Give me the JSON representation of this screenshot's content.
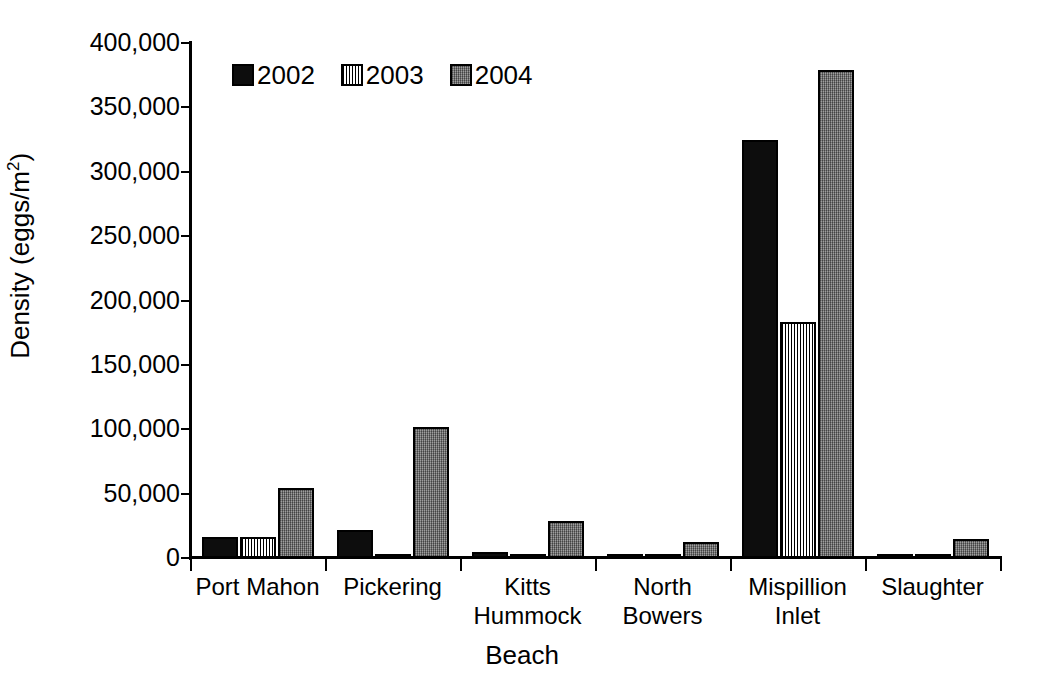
{
  "chart_data": {
    "type": "bar",
    "title": "",
    "xlabel": "Beach",
    "ylabel": "Density (eggs/m2)",
    "ylabel_base": "Density (eggs/m",
    "ylabel_sup": "2",
    "ylabel_close": ")",
    "categories": [
      "Port Mahon",
      "Pickering",
      "Kitts Hummock",
      "North Bowers",
      "Mispillion Inlet",
      "Slaughter"
    ],
    "category_lines": [
      [
        "Port Mahon"
      ],
      [
        "Pickering"
      ],
      [
        "Kitts",
        "Hummock"
      ],
      [
        "North",
        "Bowers"
      ],
      [
        "Mispillion",
        "Inlet"
      ],
      [
        "Slaughter"
      ]
    ],
    "series": [
      {
        "name": "2002",
        "pattern": "solid-black",
        "color": "#0d0d0d",
        "values": [
          16000,
          22000,
          5000,
          1500,
          325000,
          2500
        ]
      },
      {
        "name": "2003",
        "pattern": "vertical-hatch-white",
        "color": "#ffffff",
        "values": [
          16500,
          3000,
          2500,
          1500,
          183000,
          2500
        ]
      },
      {
        "name": "2004",
        "pattern": "gray-stipple",
        "color": "#7c7c7c",
        "values": [
          54000,
          102000,
          29000,
          12500,
          379000,
          15000
        ]
      }
    ],
    "ylim": [
      0,
      400000
    ],
    "ytick_values": [
      0,
      50000,
      100000,
      150000,
      200000,
      250000,
      300000,
      350000,
      400000
    ],
    "ytick_labels": [
      "0",
      "50,000",
      "100,000",
      "150,000",
      "200,000",
      "250,000",
      "300,000",
      "350,000",
      "400,000"
    ],
    "grid": false,
    "legend_position": "top-left-inside",
    "legend_entries": [
      "2002",
      "2003",
      "2004"
    ],
    "background_color": "#ffffff",
    "axis_color": "#000000"
  }
}
